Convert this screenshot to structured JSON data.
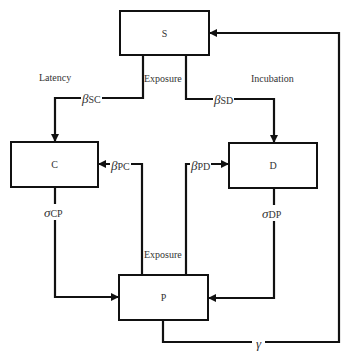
{
  "diagram": {
    "type": "compartment-flow",
    "nodes": {
      "S": {
        "label": "S"
      },
      "C": {
        "label": "C"
      },
      "D": {
        "label": "D"
      },
      "P": {
        "label": "P"
      }
    },
    "annotations": {
      "latency": "Latency",
      "exposure_top": "Exposure",
      "incubation": "Incubation",
      "exposure_bottom": "Exposure"
    },
    "edges": {
      "SC": {
        "symbol": "β",
        "sub": "SC",
        "from": "S",
        "to": "C"
      },
      "SD": {
        "symbol": "β",
        "sub": "SD",
        "from": "S",
        "to": "D"
      },
      "PC": {
        "symbol": "β",
        "sub": "PC",
        "from": "P",
        "to": "C"
      },
      "PD": {
        "symbol": "β",
        "sub": "PD",
        "from": "P",
        "to": "D"
      },
      "CP": {
        "symbol": "σ",
        "sub": "CP",
        "from": "C",
        "to": "P"
      },
      "DP": {
        "symbol": "σ",
        "sub": "DP",
        "from": "D",
        "to": "P"
      },
      "PS": {
        "symbol": "γ",
        "sub": "",
        "from": "P",
        "to": "S"
      }
    },
    "colors": {
      "line": "#111111",
      "text": "#333333",
      "background": "#ffffff"
    }
  }
}
